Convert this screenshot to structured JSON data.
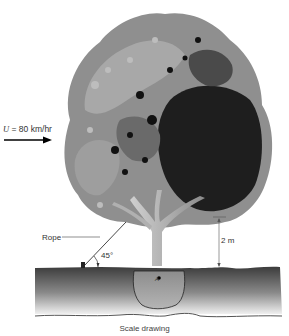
{
  "figure": {
    "type": "engineering-illustration",
    "wind": {
      "symbol": "U",
      "equals": "=",
      "value": "80",
      "unit": "km/hr",
      "label_full": "U = 80 km/hr"
    },
    "rope": {
      "label": "Rope",
      "angle_label": "45°"
    },
    "height_dimension": {
      "label": "2 m"
    },
    "pivot_point": {
      "label": "A"
    },
    "caption": "Scale drawing",
    "colors": {
      "foliage_light": "#9a9a9a",
      "foliage_mid": "#6e6e6e",
      "foliage_dark": "#1a1a1a",
      "ground_top": "#3a3a3a",
      "ground_bottom": "#e0e0e0",
      "trunk": "#b8b8b8"
    }
  }
}
